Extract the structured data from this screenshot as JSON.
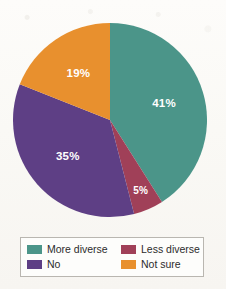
{
  "chart_data": {
    "type": "pie",
    "title": "",
    "subtitle": "",
    "categories": [
      "More diverse",
      "Less diverse",
      "No",
      "Not sure"
    ],
    "values": [
      41,
      5,
      35,
      19
    ],
    "value_labels": [
      "41%",
      "5%",
      "35%",
      "19%"
    ],
    "unit": "%",
    "start_angle_deg": 0,
    "direction": "clockwise",
    "legend_position": "bottom",
    "legend_columns": 2,
    "grid": false,
    "slices": [
      {
        "label": "More diverse",
        "value": 41,
        "value_label": "41%",
        "color": "#4b9589",
        "start_deg": 0,
        "end_deg": 147.6,
        "label_color": "#ffffff"
      },
      {
        "label": "Less diverse",
        "value": 5,
        "value_label": "5%",
        "color": "#a04058",
        "start_deg": 147.6,
        "end_deg": 165.6,
        "label_color": "#ffffff"
      },
      {
        "label": "No",
        "value": 35,
        "value_label": "35%",
        "color": "#5e3f85",
        "start_deg": 165.6,
        "end_deg": 291.6,
        "label_color": "#ffffff"
      },
      {
        "label": "Not sure",
        "value": 19,
        "value_label": "19%",
        "color": "#e8902e",
        "start_deg": 291.6,
        "end_deg": 360,
        "label_color": "#ffffff"
      }
    ]
  },
  "legend": {
    "items": [
      {
        "label": "More diverse",
        "color": "#4b9589"
      },
      {
        "label": "Less diverse",
        "color": "#a04058"
      },
      {
        "label": "No",
        "color": "#5e3f85"
      },
      {
        "label": "Not sure",
        "color": "#e8902e"
      }
    ]
  },
  "colors": {
    "more_diverse": "#4b9589",
    "less_diverse": "#a04058",
    "no": "#5e3f85",
    "not_sure": "#e8902e",
    "page_background": "#fbfaf7",
    "legend_border": "#b9b6b0",
    "legend_text": "#2c2c2c"
  }
}
